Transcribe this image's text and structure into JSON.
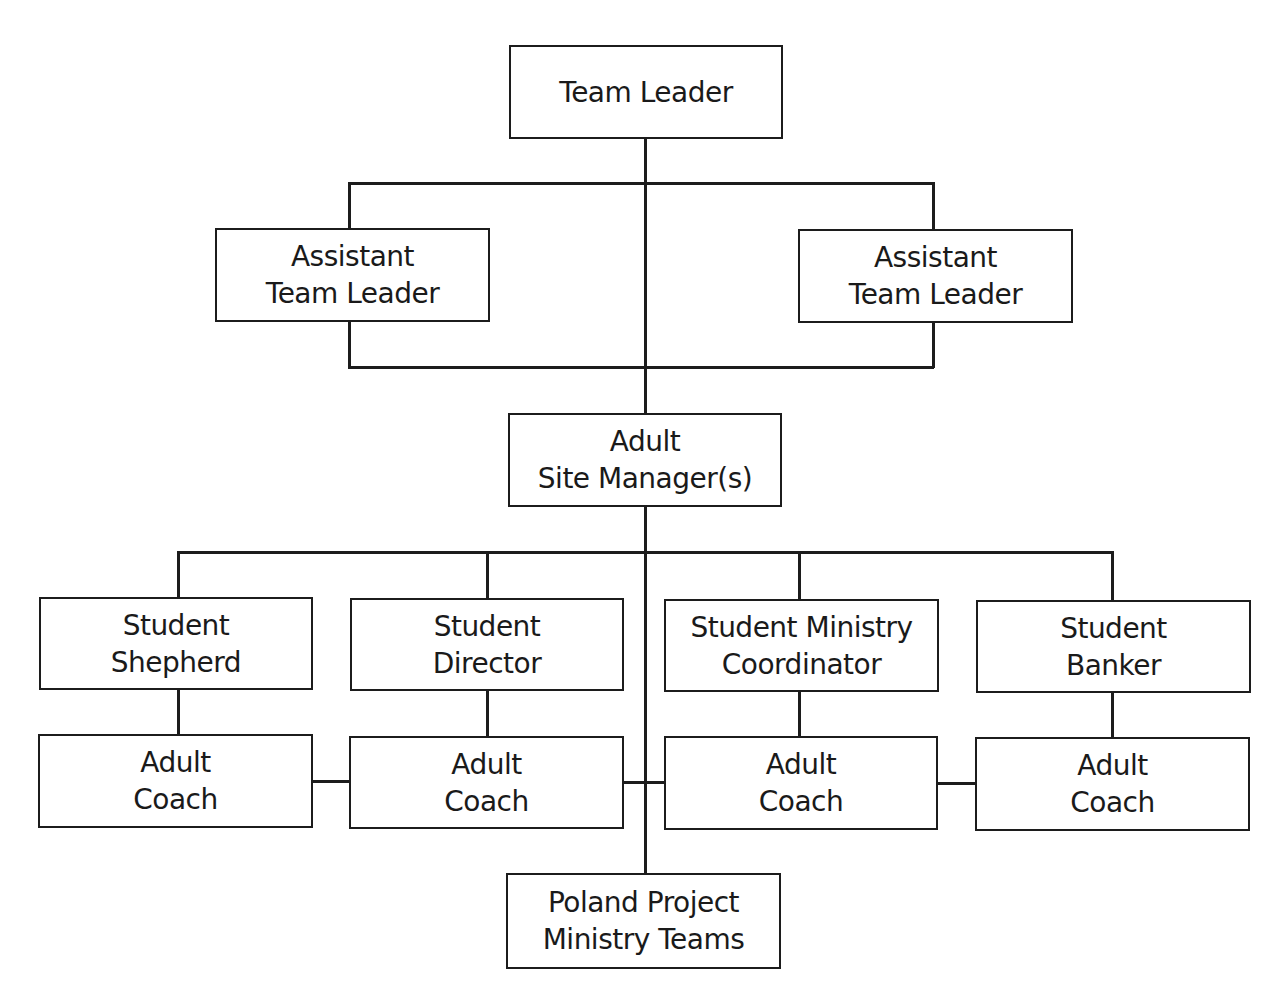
{
  "diagram": {
    "type": "org-chart",
    "nodes": {
      "team_leader": {
        "line1": "Team Leader",
        "line2": ""
      },
      "assistant_left": {
        "line1": "Assistant",
        "line2": "Team Leader"
      },
      "assistant_right": {
        "line1": "Assistant",
        "line2": "Team Leader"
      },
      "site_manager": {
        "line1": "Adult",
        "line2": "Site Manager(s)"
      },
      "student_shepherd": {
        "line1": "Student",
        "line2": "Shepherd"
      },
      "student_director": {
        "line1": "Student",
        "line2": "Director"
      },
      "student_ministry_coordinator": {
        "line1": "Student Ministry",
        "line2": "Coordinator"
      },
      "student_banker": {
        "line1": "Student",
        "line2": "Banker"
      },
      "coach_1": {
        "line1": "Adult",
        "line2": "Coach"
      },
      "coach_2": {
        "line1": "Adult",
        "line2": "Coach"
      },
      "coach_3": {
        "line1": "Adult",
        "line2": "Coach"
      },
      "coach_4": {
        "line1": "Adult",
        "line2": "Coach"
      },
      "ministry_teams": {
        "line1": "Poland Project",
        "line2": "Ministry Teams"
      }
    },
    "edges": [
      [
        "team_leader",
        "assistant_left"
      ],
      [
        "team_leader",
        "assistant_right"
      ],
      [
        "team_leader",
        "site_manager"
      ],
      [
        "assistant_left",
        "site_manager"
      ],
      [
        "assistant_right",
        "site_manager"
      ],
      [
        "site_manager",
        "student_shepherd"
      ],
      [
        "site_manager",
        "student_director"
      ],
      [
        "site_manager",
        "student_ministry_coordinator"
      ],
      [
        "site_manager",
        "student_banker"
      ],
      [
        "site_manager",
        "ministry_teams"
      ],
      [
        "student_shepherd",
        "coach_1"
      ],
      [
        "student_director",
        "coach_2"
      ],
      [
        "student_ministry_coordinator",
        "coach_3"
      ],
      [
        "student_banker",
        "coach_4"
      ],
      [
        "coach_1",
        "coach_2"
      ],
      [
        "coach_2",
        "coach_3"
      ],
      [
        "coach_3",
        "coach_4"
      ]
    ]
  }
}
